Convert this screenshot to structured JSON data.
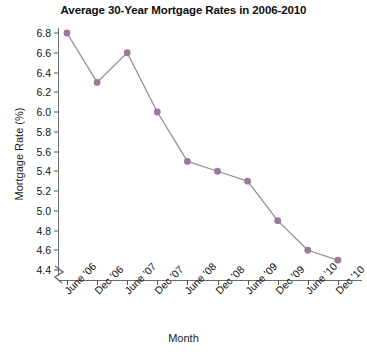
{
  "chart_data": {
    "type": "line",
    "title": "Average 30-Year Mortgage Rates in 2006-2010",
    "xlabel": "Month",
    "ylabel": "Mortgage Rate (%)",
    "categories": [
      "June '06",
      "Dec '06",
      "June '07",
      "Dec '07",
      "June '08",
      "Dec '08",
      "June '09",
      "Dec '09",
      "June '10",
      "Dec '10"
    ],
    "values": [
      6.8,
      6.3,
      6.6,
      6.0,
      5.5,
      5.4,
      5.3,
      4.9,
      4.6,
      4.5
    ],
    "series": [
      {
        "name": "Average 30-Year Mortgage Rate",
        "values": [
          6.8,
          6.3,
          6.6,
          6.0,
          5.5,
          5.4,
          5.3,
          4.9,
          4.6,
          4.5
        ]
      }
    ],
    "ylim": [
      4.4,
      6.8
    ],
    "ytick_step": 0.2,
    "yticks": [
      "6.8",
      "6.6",
      "6.4",
      "6.2",
      "6.0",
      "5.8",
      "5.6",
      "5.4",
      "5.2",
      "5.0",
      "4.8",
      "4.6",
      "4.4"
    ],
    "grid": false,
    "legend": false,
    "legend_position": "none",
    "axis_break": true,
    "marker_color": "#9a7a9a",
    "line_color": "#9a8a9a",
    "axis_color": "#6b6b6b",
    "text_color": "#111111",
    "background_color": "#ffffff"
  }
}
